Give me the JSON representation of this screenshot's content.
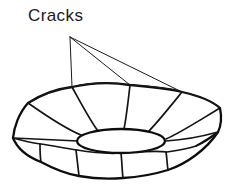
{
  "figure": {
    "domain": "diagram",
    "title_label": "Cracks",
    "background_color": "#ffffff",
    "ink_color": "#0d0d0d",
    "canvas": {
      "width": 232,
      "height": 190
    }
  },
  "callout": {
    "label": "Cracks",
    "label_position": {
      "x": 28,
      "y": 7
    },
    "leader_origin": {
      "x": 70,
      "y": 37
    },
    "leader_targets": [
      {
        "x": 72,
        "y": 87,
        "name": "crack-left"
      },
      {
        "x": 130,
        "y": 85,
        "name": "crack-center"
      },
      {
        "x": 182,
        "y": 92,
        "name": "crack-right"
      }
    ],
    "leader_count": 3
  },
  "object": {
    "name": "scalloped-bowl",
    "rim_vertices": [
      {
        "x": 13,
        "y": 138
      },
      {
        "x": 28,
        "y": 103
      },
      {
        "x": 72,
        "y": 87
      },
      {
        "x": 130,
        "y": 85
      },
      {
        "x": 182,
        "y": 92
      },
      {
        "x": 220,
        "y": 108
      },
      {
        "x": 218,
        "y": 132
      }
    ],
    "base_ellipse": {
      "cx": 121,
      "cy": 141,
      "rx": 44,
      "ry": 12
    },
    "crack_line_count": 9,
    "front_petal_count": 5,
    "bottom_center": {
      "x": 122,
      "y": 178
    }
  }
}
